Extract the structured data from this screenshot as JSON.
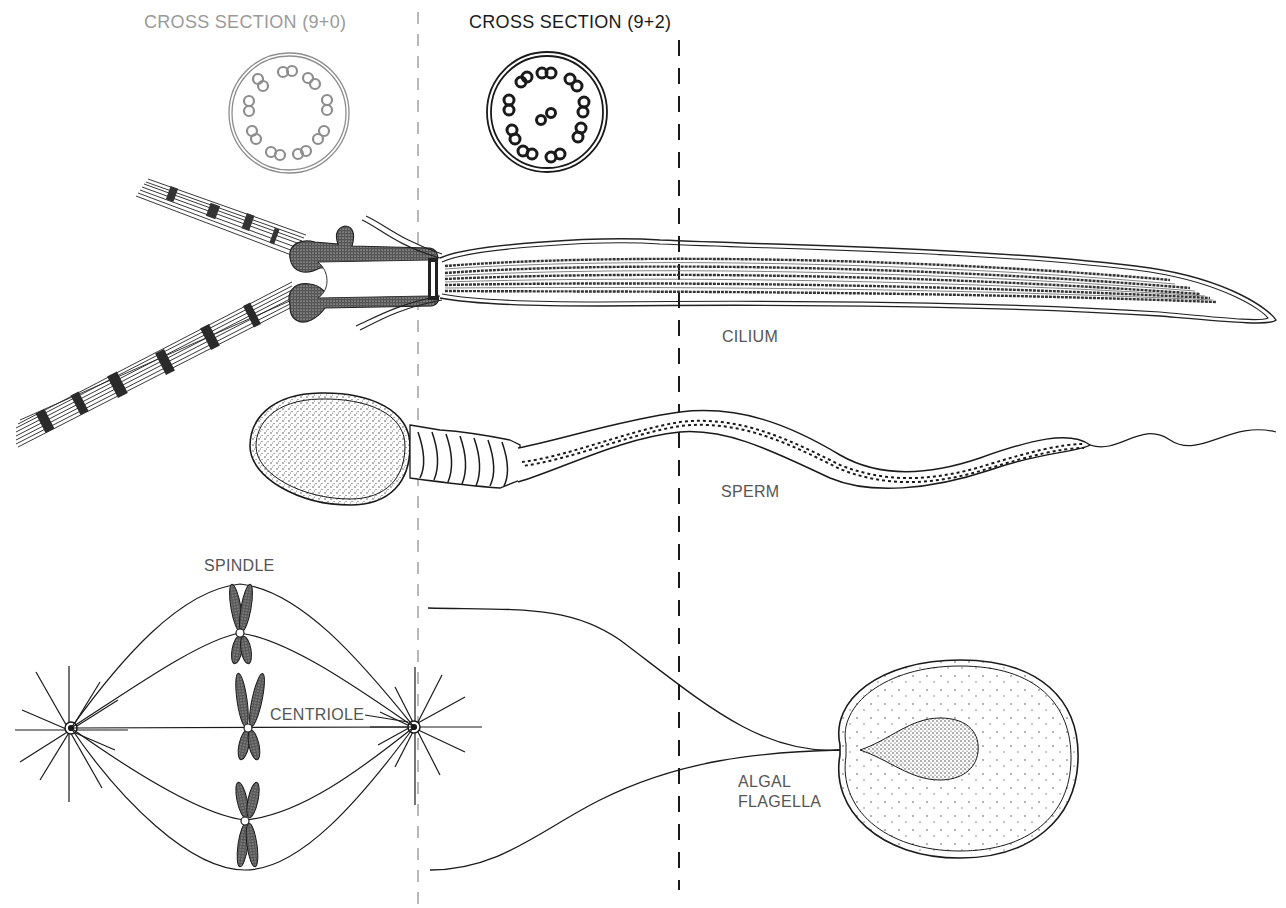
{
  "diagram": {
    "labels": {
      "cross_section_9_0": "CROSS SECTION (9+0)",
      "cross_section_9_2": "CROSS SECTION (9+2)",
      "cilium": "CILIUM",
      "sperm": "SPERM",
      "spindle": "SPINDLE",
      "centriole": "CENTRIOLE",
      "algal_flagella_line1": "ALGAL",
      "algal_flagella_line2": "FLAGELLA"
    },
    "colors": {
      "ink": "#1a1a1a",
      "faded_ink": "#9a9a9a",
      "label_gray": "#555555",
      "background": "#ffffff"
    },
    "cross_sections": [
      {
        "id": "9+0",
        "doublets": 9,
        "central": 0
      },
      {
        "id": "9+2",
        "doublets": 9,
        "central": 2
      }
    ]
  }
}
